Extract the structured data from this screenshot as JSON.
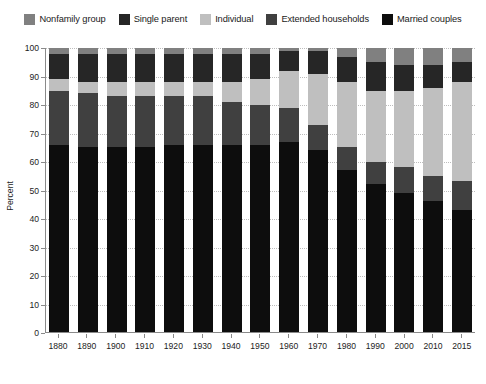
{
  "legend": {
    "position": "top-center",
    "items": [
      {
        "label": "Nonfamily group",
        "color": "#808080"
      },
      {
        "label": "Single parent",
        "color": "#262626"
      },
      {
        "label": "Individual",
        "color": "#bfbfbf"
      },
      {
        "label": "Extended households",
        "color": "#404040"
      },
      {
        "label": "Married couples",
        "color": "#0d0d0d"
      }
    ]
  },
  "axes": {
    "ylabel": "Percent",
    "yticks": [
      0,
      10,
      20,
      30,
      40,
      50,
      60,
      70,
      80,
      90,
      100
    ],
    "ylim": [
      0,
      100
    ],
    "grid": true
  },
  "chart_data": {
    "type": "bar",
    "title": "",
    "subtitle": "",
    "xlabel": "",
    "ylabel": "Percent",
    "ylim": [
      0,
      100
    ],
    "grid": true,
    "stacked": true,
    "legend_position": "top-center",
    "categories": [
      "1880",
      "1890",
      "1900",
      "1910",
      "1920",
      "1930",
      "1940",
      "1950",
      "1960",
      "1970",
      "1980",
      "1990",
      "2000",
      "2010",
      "2015"
    ],
    "series": [
      {
        "name": "Married couples",
        "color": "#0d0d0d",
        "values": [
          66,
          65,
          65,
          65,
          66,
          66,
          66,
          66,
          67,
          64,
          57,
          52,
          49,
          46,
          43
        ]
      },
      {
        "name": "Extended households",
        "color": "#404040",
        "values": [
          19,
          19,
          18,
          18,
          17,
          17,
          15,
          14,
          12,
          9,
          8,
          8,
          9,
          9,
          10
        ]
      },
      {
        "name": "Individual",
        "color": "#bfbfbf",
        "values": [
          4,
          4,
          5,
          5,
          5,
          5,
          7,
          9,
          13,
          18,
          23,
          25,
          27,
          31,
          35
        ]
      },
      {
        "name": "Single parent",
        "color": "#262626",
        "values": [
          9,
          10,
          10,
          10,
          10,
          10,
          10,
          9,
          7,
          8,
          9,
          10,
          9,
          8,
          7
        ]
      },
      {
        "name": "Nonfamily group",
        "color": "#808080",
        "values": [
          2,
          2,
          2,
          2,
          2,
          2,
          2,
          2,
          1,
          1,
          3,
          5,
          6,
          6,
          5
        ]
      }
    ]
  }
}
